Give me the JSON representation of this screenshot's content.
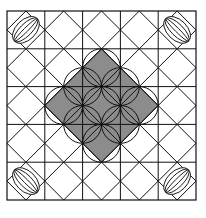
{
  "figure": {
    "colors": {
      "fill": "#8c8c8c",
      "stroke": "#111111",
      "background": "#ffffff"
    },
    "grid": {
      "rows": 5,
      "cols": 5
    }
  }
}
